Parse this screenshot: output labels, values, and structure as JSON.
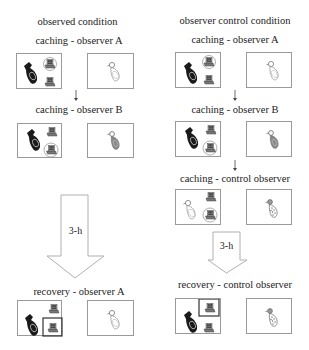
{
  "left_column": {
    "title": "observed condition",
    "steps": [
      {
        "label": "caching - observer A",
        "panels": [
          "cacher-with-trays-observer-A",
          "observer-A-bird"
        ]
      },
      {
        "label": "caching - observer B",
        "panels": [
          "cacher-with-trays-observer-B",
          "observer-B-bird"
        ]
      },
      {
        "label": "recovery - observer A",
        "panels": [
          "cacher-recovering-trays",
          "observer-A-bird"
        ]
      }
    ],
    "delay_label": "3-h"
  },
  "right_column": {
    "title": "observer control condition",
    "steps": [
      {
        "label": "caching - observer A",
        "panels": [
          "cacher-with-trays-observer-A",
          "observer-A-bird"
        ]
      },
      {
        "label": "caching - observer B",
        "panels": [
          "cacher-with-trays-observer-B",
          "observer-B-bird"
        ]
      },
      {
        "label": "caching - control observer",
        "panels": [
          "control-cacher-with-trays",
          "control-observer-bird"
        ]
      },
      {
        "label": "recovery - control observer",
        "panels": [
          "cacher-recovering-trays",
          "control-observer-bird"
        ]
      }
    ],
    "delay_label": "3-h"
  },
  "colors": {
    "panel_border": "#9a9a9a",
    "arrow_outline": "#b0b0b0",
    "text": "#222222",
    "highlight_box": "#333333"
  }
}
